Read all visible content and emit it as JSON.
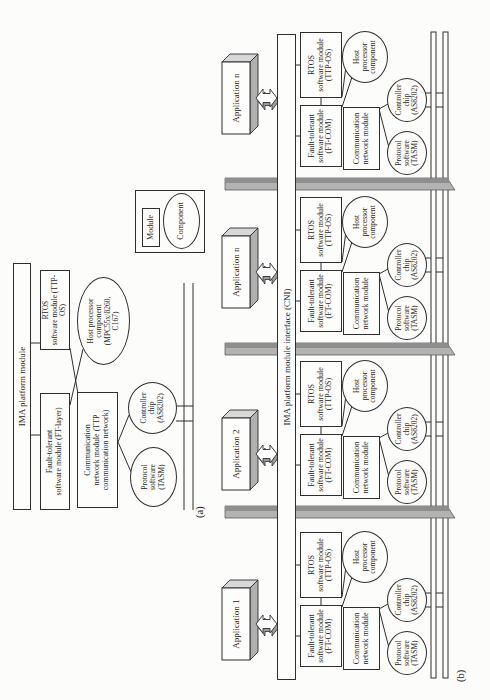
{
  "figure": {
    "panel_a": {
      "label": "(a)",
      "platform_bar": "IMA platform module",
      "ft_box": [
        "Fault-tolerant",
        "software module (FT-layer)"
      ],
      "rtos_box": [
        "RTOS",
        "software module (TTP-OS)"
      ],
      "comm_box": [
        "Communication",
        "network module (TTP",
        "communication network)"
      ],
      "host_ellipse": [
        "Host processor",
        "component",
        "(MPC55x/8260,",
        "C167)"
      ],
      "protocol_ellipse": [
        "Protocol",
        "software",
        "(TASM)"
      ],
      "controller_ellipse": [
        "Controller",
        "chip",
        "(AS8202)"
      ]
    },
    "legend": {
      "module": "Module",
      "component": "Component"
    },
    "panel_b": {
      "label": "(b)",
      "cni_bar": "IMA platform module interface (CNI)",
      "applications": [
        "Application 1",
        "Application 2",
        "Application n",
        "Application n"
      ],
      "group": {
        "ft_box": [
          "Fault-tolerant",
          "software module",
          "(FT-COM)"
        ],
        "rtos_box": [
          "RTOS",
          "software module",
          "(TTP-OS)"
        ],
        "comm_box": [
          "Communication",
          "network module"
        ],
        "host_ellipse": [
          "Host",
          "processor",
          "component"
        ],
        "protocol_ellipse": [
          "Protocol",
          "software",
          "(TASM)"
        ],
        "controller_ellipse": [
          "Controller",
          "chip",
          "(AS8202)"
        ]
      }
    },
    "colors": {
      "ink": "#2f2f2f",
      "background": "#fcfcfb",
      "divider_light": "#b3b3b3",
      "divider_dark": "#8e8e8e",
      "box_side_light": "#d8d8d8",
      "box_side_dark": "#b0b0b0",
      "arrow_shadow": "#9a9a9a"
    }
  }
}
